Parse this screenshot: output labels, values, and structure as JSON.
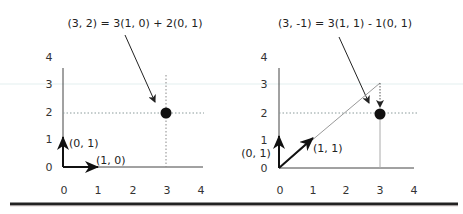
{
  "colors": {
    "ink": "#1a1a1a",
    "axis": "#444444",
    "grid_dotted": "#888888",
    "dotted_light": "#9aa6a6",
    "point": "#111111",
    "rule": "#222222",
    "scan_line": "#e6f1f1"
  },
  "panels": [
    {
      "title": "(3, 2) = 3(1, 0) + 2(0, 1)",
      "x_ticks": [
        "0",
        "1",
        "2",
        "3",
        "4"
      ],
      "y_ticks": [
        "0",
        "1",
        "2",
        "3",
        "4"
      ],
      "vectors": [
        {
          "label": "(0, 1)",
          "from": [
            0,
            0
          ],
          "to": [
            0,
            1
          ]
        },
        {
          "label": "(1, 0)",
          "from": [
            0,
            0
          ],
          "to": [
            1,
            0
          ]
        }
      ],
      "point": [
        3,
        2
      ]
    },
    {
      "title": "(3, -1) = 3(1, 1) - 1(0, 1)",
      "x_ticks": [
        "0",
        "1",
        "2",
        "3",
        "4"
      ],
      "y_ticks": [
        "0",
        "1",
        "2",
        "3",
        "4"
      ],
      "vectors": [
        {
          "label": "(0, 1)",
          "from": [
            0,
            0
          ],
          "to": [
            0,
            1
          ]
        },
        {
          "label": "(1, 1)",
          "from": [
            0,
            0
          ],
          "to": [
            1,
            1
          ]
        }
      ],
      "point": [
        3,
        2
      ],
      "construction": {
        "diagonal_to": [
          3,
          3
        ],
        "down_step_to": [
          3,
          2
        ]
      }
    }
  ]
}
